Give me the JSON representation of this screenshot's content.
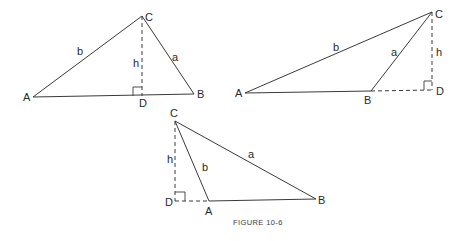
{
  "caption": "FIGURE 10-6",
  "figures": [
    {
      "name": "acute-triangle-altitude-inside",
      "vertices": {
        "A": "A",
        "B": "B",
        "C": "C",
        "D": "D"
      },
      "sides": {
        "a": "a",
        "b": "b",
        "h": "h"
      }
    },
    {
      "name": "obtuse-triangle-altitude-outside-right",
      "vertices": {
        "A": "A",
        "B": "B",
        "C": "C",
        "D": "D"
      },
      "sides": {
        "a": "a",
        "b": "b",
        "h": "h"
      }
    },
    {
      "name": "obtuse-triangle-altitude-outside-left",
      "vertices": {
        "A": "A",
        "B": "B",
        "C": "C",
        "D": "D"
      },
      "sides": {
        "a": "a",
        "b": "b",
        "h": "h"
      }
    }
  ]
}
